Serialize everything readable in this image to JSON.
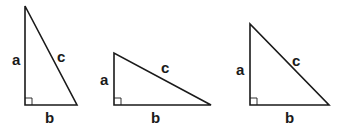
{
  "diagram": {
    "stroke_color": "#1a1a1a",
    "background": "#ffffff",
    "triangles": [
      {
        "id": "tall",
        "vertices": {
          "top": [
            25,
            6
          ],
          "right_angle": [
            25,
            105
          ],
          "right": [
            77,
            105
          ]
        },
        "labels": {
          "a": {
            "text": "a",
            "pos": [
              15,
              65
            ]
          },
          "b": {
            "text": "b",
            "pos": [
              49,
              122
            ]
          },
          "c": {
            "text": "c",
            "pos": [
              61,
              62
            ]
          }
        }
      },
      {
        "id": "wide",
        "vertices": {
          "top": [
            114,
            53
          ],
          "right_angle": [
            114,
            105
          ],
          "right": [
            211,
            105
          ]
        },
        "labels": {
          "a": {
            "text": "a",
            "pos": [
              103,
              85
            ]
          },
          "b": {
            "text": "b",
            "pos": [
              155,
              122
            ]
          },
          "c": {
            "text": "c",
            "pos": [
              165,
              74
            ]
          }
        }
      },
      {
        "id": "isosceles",
        "vertices": {
          "top": [
            250,
            24
          ],
          "right_angle": [
            250,
            105
          ],
          "right": [
            329,
            105
          ]
        },
        "labels": {
          "a": {
            "text": "a",
            "pos": [
              239,
              74
            ]
          },
          "b": {
            "text": "b",
            "pos": [
              289,
              122
            ]
          },
          "c": {
            "text": "c",
            "pos": [
              296,
              66
            ]
          }
        }
      }
    ]
  }
}
